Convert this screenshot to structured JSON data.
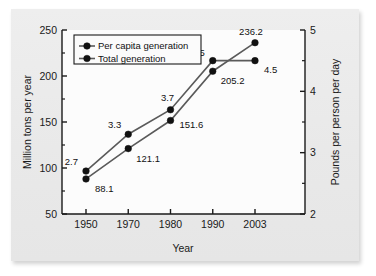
{
  "chart_data": {
    "type": "line",
    "title": "",
    "xlabel": "Year",
    "ylabel": "Million tons per year",
    "y2label": "Pounds per person per day",
    "categories": [
      "1950",
      "1970",
      "1980",
      "1990",
      "2003"
    ],
    "x_tick_labels": [
      "1950",
      "1970",
      "1980",
      "1990",
      "2003"
    ],
    "ylim": [
      50,
      250
    ],
    "y_tick_labels": [
      "250",
      "200",
      "150",
      "100",
      "50"
    ],
    "y_tick_values": [
      250,
      200,
      150,
      100,
      50
    ],
    "y_minor_values": [
      225,
      175,
      125,
      75
    ],
    "y2lim": [
      2,
      5
    ],
    "y2_tick_labels": [
      "5",
      "4",
      "3",
      "2"
    ],
    "y2_tick_values": [
      5,
      4,
      3,
      2
    ],
    "y2_minor_values": [
      4.5,
      3.5,
      2.5
    ],
    "grid": false,
    "legend_position": "upper left",
    "series": [
      {
        "name": "Per capita generation",
        "axis": "right",
        "unit": "pounds per person per day",
        "values": [
          2.7,
          3.3,
          3.7,
          4.5,
          4.5
        ],
        "labels": [
          "2.7",
          "3.3",
          "3.7",
          "4.5",
          "4.5"
        ]
      },
      {
        "name": "Total generation",
        "axis": "left",
        "unit": "million tons per year",
        "values": [
          88.1,
          121.1,
          151.6,
          205.2,
          236.2
        ],
        "labels": [
          "88.1",
          "121.1",
          "151.6",
          "205.2",
          "236.2"
        ]
      }
    ],
    "legend_entries": [
      "Per capita generation",
      "Total generation"
    ],
    "colors": {
      "line": "#5a5a5a",
      "marker": "#111111",
      "axis": "#1a1a1a",
      "plot_background": "#fcfcfc",
      "card_background": "#eaeaea"
    }
  }
}
